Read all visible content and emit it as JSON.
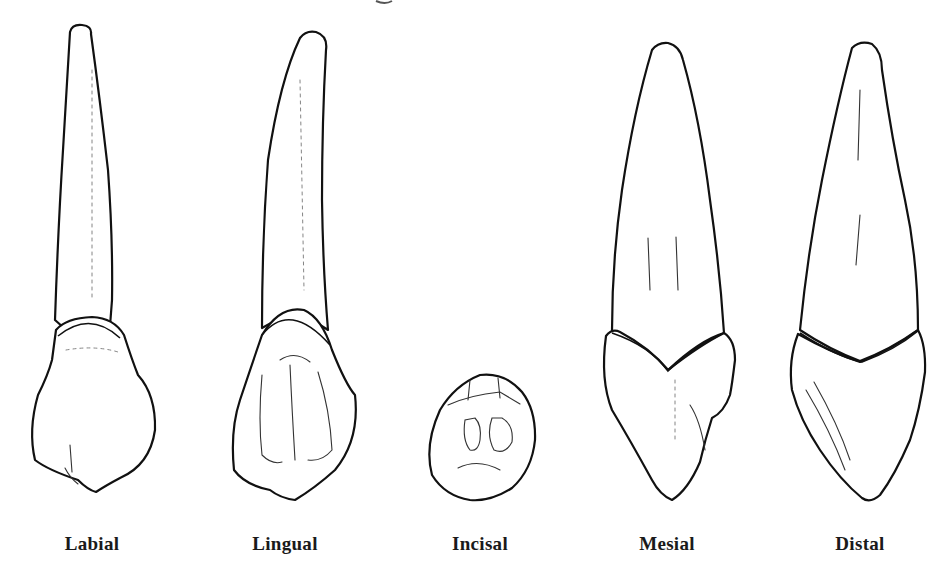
{
  "figure": {
    "views": [
      {
        "id": "labial",
        "label": "Labial",
        "center_x": 92
      },
      {
        "id": "lingual",
        "label": "Lingual",
        "center_x": 285
      },
      {
        "id": "incisal",
        "label": "Incisal",
        "center_x": 480
      },
      {
        "id": "mesial",
        "label": "Mesial",
        "center_x": 667
      },
      {
        "id": "distal",
        "label": "Distal",
        "center_x": 860
      }
    ]
  },
  "colors": {
    "background": "#ffffff",
    "ink": "#111111"
  }
}
